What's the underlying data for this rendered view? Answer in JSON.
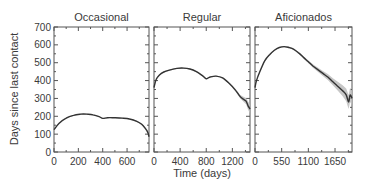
{
  "chart_data": [
    {
      "type": "line",
      "title": "Occasional",
      "xlabel": "",
      "ylabel": "Days since last contact",
      "xlim": [
        0,
        780
      ],
      "ylim": [
        0,
        700
      ],
      "xticks": [
        0,
        200,
        400,
        600
      ],
      "yticks": [
        0,
        100,
        200,
        300,
        400,
        500,
        600,
        700
      ],
      "series": [
        {
          "name": "mean",
          "x": [
            0,
            40,
            100,
            160,
            220,
            270,
            320,
            370,
            400,
            440,
            500,
            560,
            620,
            680,
            720,
            750,
            770,
            780
          ],
          "y": [
            125,
            160,
            190,
            205,
            212,
            212,
            208,
            198,
            188,
            192,
            192,
            190,
            185,
            172,
            155,
            132,
            110,
            85
          ],
          "band": [
            2,
            2,
            2,
            2,
            2,
            2,
            2,
            2,
            2,
            2,
            2,
            2,
            2,
            3,
            4,
            6,
            10,
            14
          ]
        }
      ]
    },
    {
      "type": "line",
      "title": "Regular",
      "xlabel": "Time (days)",
      "ylabel": "",
      "xlim": [
        0,
        1470
      ],
      "ylim": [
        0,
        700
      ],
      "xticks": [
        0,
        400,
        800,
        1200
      ],
      "yticks": [
        0,
        100,
        200,
        300,
        400,
        500,
        600,
        700
      ],
      "series": [
        {
          "name": "mean",
          "x": [
            0,
            30,
            80,
            150,
            250,
            350,
            450,
            550,
            650,
            750,
            800,
            860,
            950,
            1050,
            1150,
            1250,
            1320,
            1370,
            1410,
            1440,
            1470
          ],
          "y": [
            360,
            405,
            430,
            448,
            460,
            468,
            470,
            465,
            450,
            425,
            410,
            420,
            425,
            415,
            385,
            345,
            310,
            295,
            285,
            260,
            240
          ],
          "band": [
            3,
            3,
            3,
            3,
            3,
            3,
            3,
            3,
            3,
            3,
            3,
            3,
            3,
            4,
            5,
            7,
            10,
            14,
            18,
            22,
            26
          ]
        }
      ]
    },
    {
      "type": "line",
      "title": "Aficionados",
      "xlabel": "",
      "ylabel": "",
      "xlim": [
        0,
        2000
      ],
      "ylim": [
        0,
        700
      ],
      "xticks": [
        0,
        550,
        1100,
        1650
      ],
      "yticks": [
        0,
        100,
        200,
        300,
        400,
        500,
        600,
        700
      ],
      "series": [
        {
          "name": "mean",
          "x": [
            0,
            30,
            100,
            200,
            300,
            400,
            500,
            600,
            700,
            800,
            900,
            1000,
            1100,
            1200,
            1300,
            1400,
            1500,
            1600,
            1700,
            1800,
            1880,
            1930,
            1960,
            2000
          ],
          "y": [
            360,
            400,
            450,
            510,
            545,
            570,
            585,
            590,
            585,
            575,
            555,
            530,
            505,
            480,
            460,
            440,
            420,
            395,
            370,
            345,
            320,
            280,
            320,
            300
          ],
          "band": [
            3,
            3,
            3,
            3,
            3,
            3,
            3,
            3,
            4,
            4,
            5,
            6,
            8,
            10,
            12,
            14,
            16,
            20,
            24,
            30,
            36,
            40,
            40,
            40
          ]
        }
      ]
    }
  ],
  "shared": {
    "xlabel": "Time (days)",
    "ylabel": "Days since last contact"
  }
}
